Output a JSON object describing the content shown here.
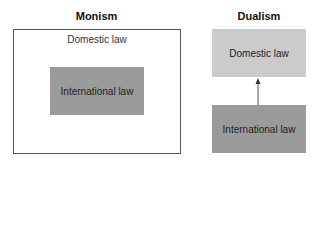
{
  "monism": {
    "title": "Monism",
    "outer_label": "Domestic law",
    "inner_label": "International law",
    "colors": {
      "outer_border": "#555555",
      "inner_fill": "#9b9b9b"
    }
  },
  "dualism": {
    "title": "Dualism",
    "top_label": "Domestic law",
    "bottom_label": "International law",
    "colors": {
      "top_fill": "#cbcbcb",
      "bottom_fill": "#9b9b9b",
      "arrow": "#555555"
    },
    "arrow_direction": "up"
  }
}
